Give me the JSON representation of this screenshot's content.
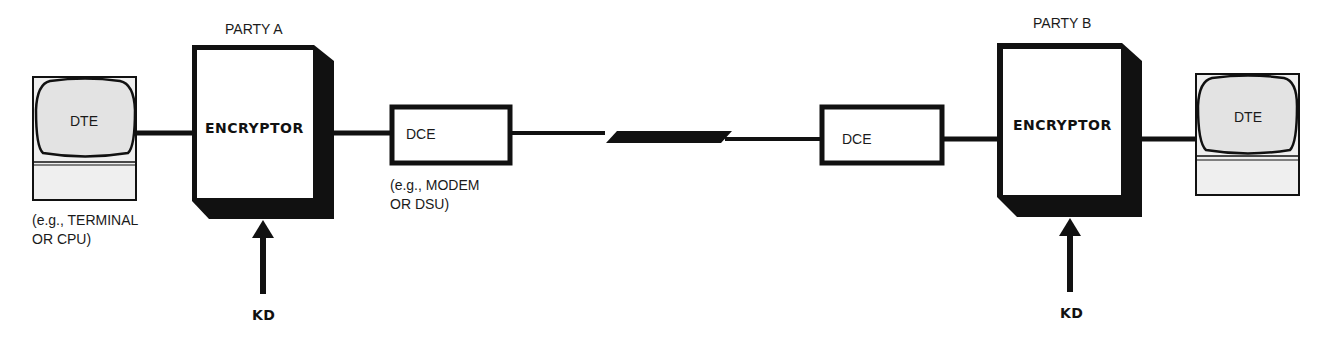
{
  "diagram": {
    "type": "link-encryption-block-diagram",
    "party_a": {
      "label": "PARTY A",
      "dte": {
        "label": "DTE",
        "note_line1": "(e.g., TERMINAL",
        "note_line2": "OR CPU)"
      },
      "encryptor": {
        "label": "ENCRYPTOR"
      },
      "dce": {
        "label": "DCE",
        "note_line1": "(e.g., MODEM",
        "note_line2": "OR DSU)"
      },
      "key_input": {
        "label": "KD"
      }
    },
    "party_b": {
      "label": "PARTY B",
      "dte": {
        "label": "DTE"
      },
      "encryptor": {
        "label": "ENCRYPTOR"
      },
      "dce": {
        "label": "DCE"
      },
      "key_input": {
        "label": "KD"
      }
    },
    "link": {
      "style": "communications-line-with-lightning-break"
    },
    "colors": {
      "stroke": "#111111",
      "screen_fill": "#e6e6e6",
      "base_fill": "#eeeeee",
      "background": "#ffffff"
    }
  }
}
